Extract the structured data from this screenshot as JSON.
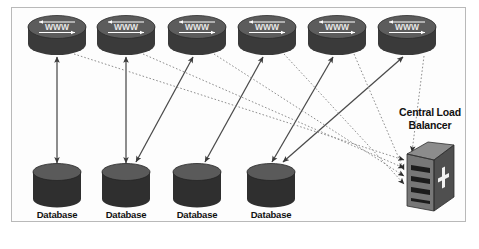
{
  "diagram": {
    "frame": {
      "border_color": "#b9b9b9",
      "background": "#fdfdfd"
    },
    "colors": {
      "cylinder_body_dark": "#3a3a3a",
      "cylinder_top_gray": "#555555",
      "db_body": "#2f2f2f",
      "db_top": "#5a5a5a",
      "server_face": "#6e6e6e",
      "server_side": "#4a4a4a",
      "solid_line": "#4a4a4a",
      "dotted_line": "#8e8e8e",
      "text": "#111111"
    },
    "web_servers": [
      {
        "id": "www-1",
        "label": "WWW",
        "cx": 57,
        "cy": 36
      },
      {
        "id": "www-2",
        "label": "WWW",
        "cx": 126,
        "cy": 36
      },
      {
        "id": "www-3",
        "label": "WWW",
        "cx": 197,
        "cy": 36
      },
      {
        "id": "www-4",
        "label": "WWW",
        "cx": 267,
        "cy": 36
      },
      {
        "id": "www-5",
        "label": "WWW",
        "cx": 337,
        "cy": 36
      },
      {
        "id": "www-6",
        "label": "WWW",
        "cx": 407,
        "cy": 36
      }
    ],
    "databases": [
      {
        "id": "db-1",
        "label": "Database",
        "cx": 57,
        "cy": 185
      },
      {
        "id": "db-2",
        "label": "Database",
        "cx": 126,
        "cy": 185
      },
      {
        "id": "db-3",
        "label": "Database",
        "cx": 197,
        "cy": 185
      },
      {
        "id": "db-4",
        "label": "Database",
        "cx": 271,
        "cy": 185
      }
    ],
    "load_balancer": {
      "id": "central-load-balancer",
      "label_line1": "Central Load",
      "label_line2": "Balancer",
      "cx": 429,
      "cy": 180
    },
    "solid_links": [
      {
        "from": "www-1",
        "to": "db-1"
      },
      {
        "from": "www-2",
        "to": "db-2"
      },
      {
        "from": "www-3",
        "to": "db-2"
      },
      {
        "from": "www-4",
        "to": "db-3"
      },
      {
        "from": "www-5",
        "to": "db-4"
      },
      {
        "from": "www-6",
        "to": "db-4"
      }
    ],
    "dotted_links": [
      {
        "from": "www-1",
        "to": "central-load-balancer"
      },
      {
        "from": "www-2",
        "to": "central-load-balancer"
      },
      {
        "from": "www-3",
        "to": "central-load-balancer"
      },
      {
        "from": "www-4",
        "to": "central-load-balancer"
      },
      {
        "from": "www-5",
        "to": "central-load-balancer"
      },
      {
        "from": "www-6",
        "to": "central-load-balancer"
      }
    ]
  }
}
